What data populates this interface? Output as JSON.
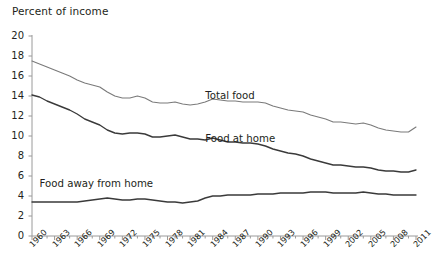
{
  "chart_data": {
    "type": "line",
    "title": "",
    "ylabel": "Percent of income",
    "xlabel": "",
    "ylim": [
      0,
      20
    ],
    "ytick_values": [
      0,
      2,
      4,
      6,
      8,
      10,
      12,
      14,
      16,
      18,
      20
    ],
    "ytick_labels": [
      "0",
      "2",
      "4",
      "6",
      "8",
      "10",
      "12",
      "14",
      "16",
      "18",
      "20"
    ],
    "xlim": [
      1960,
      2011
    ],
    "xtick_labels": [
      "1960",
      "1963",
      "1966",
      "1969",
      "1972",
      "1975",
      "1978",
      "1981",
      "1984",
      "1987",
      "1990",
      "1993",
      "1996",
      "1999",
      "2002",
      "2005",
      "2008",
      "2011"
    ],
    "xtick_values": [
      1960,
      1963,
      1966,
      1969,
      1972,
      1975,
      1978,
      1981,
      1984,
      1987,
      1990,
      1993,
      1996,
      1999,
      2002,
      2005,
      2008,
      2011
    ],
    "minor_ticks_annual": true,
    "grid": false,
    "legend_position": "inline-annotations",
    "x": [
      1960,
      1961,
      1962,
      1963,
      1964,
      1965,
      1966,
      1967,
      1968,
      1969,
      1970,
      1971,
      1972,
      1973,
      1974,
      1975,
      1976,
      1977,
      1978,
      1979,
      1980,
      1981,
      1982,
      1983,
      1984,
      1985,
      1986,
      1987,
      1988,
      1989,
      1990,
      1991,
      1992,
      1993,
      1994,
      1995,
      1996,
      1997,
      1998,
      1999,
      2000,
      2001,
      2002,
      2003,
      2004,
      2005,
      2006,
      2007,
      2008,
      2009,
      2010,
      2011
    ],
    "series": [
      {
        "name": "Total food",
        "color": "#7a7a7a",
        "label_x": 2011,
        "values": [
          17.5,
          17.2,
          16.9,
          16.6,
          16.3,
          16.0,
          15.6,
          15.3,
          15.1,
          14.9,
          14.4,
          14.0,
          13.8,
          13.8,
          14.0,
          13.8,
          13.4,
          13.3,
          13.3,
          13.4,
          13.2,
          13.1,
          13.2,
          13.4,
          13.7,
          13.6,
          13.5,
          13.5,
          13.4,
          13.4,
          13.4,
          13.3,
          13.0,
          12.8,
          12.6,
          12.5,
          12.4,
          12.1,
          11.9,
          11.7,
          11.4,
          11.4,
          11.3,
          11.2,
          11.3,
          11.1,
          10.8,
          10.6,
          10.5,
          10.4,
          10.4,
          10.9
        ]
      },
      {
        "name": "Food at home",
        "color": "#3a3a3a",
        "label_x": 1990,
        "values": [
          14.1,
          13.9,
          13.5,
          13.2,
          12.9,
          12.6,
          12.2,
          11.7,
          11.4,
          11.1,
          10.6,
          10.3,
          10.2,
          10.3,
          10.3,
          10.2,
          9.9,
          9.9,
          10.0,
          10.1,
          9.9,
          9.7,
          9.7,
          9.6,
          9.8,
          9.6,
          9.4,
          9.4,
          9.3,
          9.3,
          9.2,
          9.0,
          8.7,
          8.5,
          8.3,
          8.2,
          8.0,
          7.7,
          7.5,
          7.3,
          7.1,
          7.1,
          7.0,
          6.9,
          6.9,
          6.8,
          6.6,
          6.5,
          6.5,
          6.4,
          6.4,
          6.6
        ]
      },
      {
        "name": "Food away from home",
        "color": "#3a3a3a",
        "label_x": 1963,
        "values": [
          3.4,
          3.4,
          3.4,
          3.4,
          3.4,
          3.4,
          3.4,
          3.5,
          3.6,
          3.7,
          3.8,
          3.7,
          3.6,
          3.6,
          3.7,
          3.7,
          3.6,
          3.5,
          3.4,
          3.4,
          3.3,
          3.4,
          3.5,
          3.8,
          4.0,
          4.0,
          4.1,
          4.1,
          4.1,
          4.1,
          4.2,
          4.2,
          4.2,
          4.3,
          4.3,
          4.3,
          4.3,
          4.4,
          4.4,
          4.4,
          4.3,
          4.3,
          4.3,
          4.3,
          4.4,
          4.3,
          4.2,
          4.2,
          4.1,
          4.1,
          4.1,
          4.1
        ]
      }
    ],
    "annotations": [
      {
        "text": "Total food",
        "x": 1983,
        "y": 13.9
      },
      {
        "text": "Food at home",
        "x": 1983,
        "y": 9.6
      },
      {
        "text": "Food away from home",
        "x": 1961,
        "y": 5.1
      }
    ]
  }
}
